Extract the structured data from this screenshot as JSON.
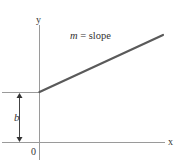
{
  "diagram": {
    "axes": {
      "x_label": "x",
      "y_label": "y",
      "origin_label": "0"
    },
    "line": {
      "annotation_var": "m",
      "annotation_rest": " = slope",
      "color": "#5a5a5a"
    },
    "intercept": {
      "label": "b"
    },
    "axis_color": "#9a9a9a"
  }
}
